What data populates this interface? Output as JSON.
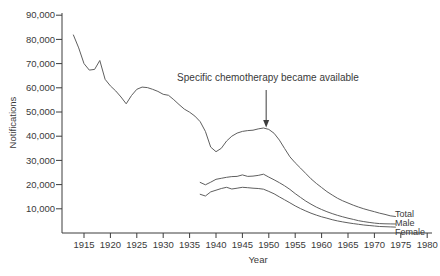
{
  "figure": {
    "ylabel": "Notifications",
    "xlabel": "Year",
    "annotation_text": "Specific chemotherapy became available"
  },
  "colors": {
    "background": "#ffffff",
    "curve": "#5f5f5f",
    "axis": "#3c3c3c",
    "text": "#3a3a3a"
  },
  "chart_data": {
    "type": "line",
    "title": "",
    "xlabel": "Year",
    "ylabel": "Notifications",
    "xlim": [
      1911,
      1981
    ],
    "ylim": [
      0,
      90000
    ],
    "grid": false,
    "legend_position": "right-end-of-lines",
    "x_ticks": {
      "values": [
        1915,
        1920,
        1925,
        1930,
        1935,
        1940,
        1945,
        1950,
        1955,
        1960,
        1965,
        1970,
        1975,
        1980
      ],
      "labels": [
        "1915",
        "1920",
        "1925",
        "1930",
        "1935",
        "1940",
        "1945",
        "1950",
        "1955",
        "1960",
        "1965",
        "1970",
        "1975",
        "1980"
      ]
    },
    "y_ticks": {
      "values": [
        10000,
        20000,
        30000,
        40000,
        50000,
        60000,
        70000,
        80000,
        90000
      ],
      "labels": [
        "10,000",
        "20,000",
        "30,000",
        "40,000",
        "50,000",
        "60,000",
        "70,000",
        "80,000",
        "90,000"
      ]
    },
    "annotations": [
      {
        "text": "Specific chemotherapy became available",
        "arrow": {
          "points_to_year": 1949.5,
          "points_to_value": 44500,
          "direction": "down"
        }
      }
    ],
    "series": [
      {
        "name": "Total",
        "start_year": 1913,
        "end_year": 1974,
        "cadence": "annual",
        "values": [
          81800,
          76500,
          70000,
          67300,
          67600,
          71300,
          63500,
          60800,
          58700,
          56200,
          53400,
          56800,
          59400,
          60300,
          60100,
          59400,
          58500,
          57300,
          56900,
          55100,
          53100,
          51200,
          49900,
          48300,
          46000,
          42000,
          35500,
          33600,
          35000,
          38000,
          40000,
          41300,
          42000,
          42300,
          42500,
          43000,
          43400,
          42800,
          41200,
          38400,
          34900,
          31500,
          29000,
          26800,
          24600,
          22400,
          20500,
          18800,
          17100,
          15700,
          14400,
          13300,
          12400,
          11500,
          10700,
          10000,
          9400,
          8800,
          8200,
          7700,
          7100,
          6800
        ]
      },
      {
        "name": "Male",
        "start_year": 1937,
        "end_year": 1974,
        "cadence": "annual",
        "values": [
          20900,
          19900,
          21000,
          22200,
          22600,
          23000,
          23300,
          23400,
          24000,
          23400,
          23500,
          23800,
          24300,
          23100,
          22000,
          20800,
          19500,
          18000,
          16300,
          14700,
          13200,
          11900,
          10700,
          9700,
          8800,
          8000,
          7300,
          6700,
          6100,
          5600,
          5100,
          4700,
          4400,
          4100,
          3900,
          3800,
          3750,
          3700
        ]
      },
      {
        "name": "Female",
        "start_year": 1937,
        "end_year": 1974,
        "cadence": "annual",
        "values": [
          16000,
          15300,
          17000,
          17700,
          18400,
          18900,
          18200,
          18500,
          18900,
          18700,
          18500,
          18400,
          18100,
          17200,
          16200,
          14900,
          13700,
          12500,
          11200,
          10100,
          9100,
          8200,
          7400,
          6700,
          6100,
          5500,
          5000,
          4600,
          4200,
          3900,
          3600,
          3300,
          3100,
          2900,
          2700,
          2600,
          2500,
          2450
        ]
      }
    ]
  }
}
